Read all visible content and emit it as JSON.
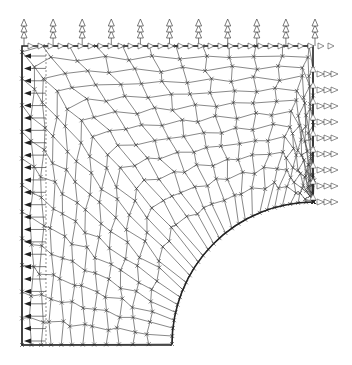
{
  "diagram": {
    "type": "fem-mesh",
    "colors": {
      "mesh": "#555555",
      "boundary": "#222222",
      "node": "#333333",
      "arrow": "#444444",
      "background": "#ffffff"
    },
    "geometry": {
      "left_x": 22,
      "top_y": 46,
      "right_x": 313,
      "bottom_y": 345,
      "hole_center": [
        314,
        344
      ],
      "hole_radius": 142
    },
    "mesh": {
      "rings": 12,
      "spokes": 14,
      "element_type": "quadrilateral",
      "node_marker": "x"
    },
    "loads": {
      "top_edge": {
        "direction": "up",
        "arrows": 11,
        "style": "stacked-triangles"
      },
      "right_edge": {
        "direction": "right",
        "arrows": 9,
        "style": "stacked-triangles"
      },
      "top_shear": {
        "direction": "right",
        "style": "triangles-along-edge"
      },
      "left_edge": {
        "direction": "left",
        "arrows": 24,
        "style": "filled-arrow",
        "note": "symmetry reactions"
      }
    }
  }
}
